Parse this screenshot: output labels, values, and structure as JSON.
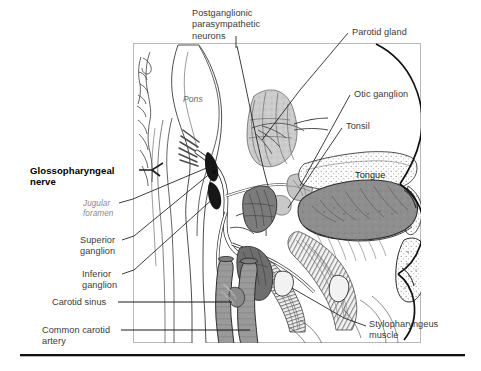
{
  "figure": {
    "title_none": "",
    "frame": {
      "x": 133,
      "y": 43,
      "width": 288,
      "height": 300,
      "border_color": "#b9b9b9"
    },
    "baseline_rule": {
      "x": 20,
      "y": 355,
      "width": 445,
      "color": "#111111"
    },
    "colors": {
      "ink": "#2b2b2b",
      "label_text": "#3a3a3a",
      "strong_text": "#000000",
      "italic_text": "#8a8a8a",
      "leader_line": "#1b1b1b",
      "frame": "#b9b9b9",
      "parotid_fill": "#c9c9c9",
      "tongue_fill": "#8e8e8e",
      "vessel_fill": "#9a9a9a",
      "tonsil_fill": "#bdbdbd",
      "muscle_fill": "#7e7e7e",
      "dark_ganglion": "#171717",
      "bone_fill": "#fbfbfb",
      "page_bg": "#ffffff"
    },
    "labels": [
      {
        "name": "postganglionic-parasympathetic-neurons",
        "text": "Postganglionic\nparasympathetic\nneurons",
        "x": 192,
        "y": 8,
        "style": "plain",
        "align": "left"
      },
      {
        "name": "parotid-gland",
        "text": "Parotid gland",
        "x": 352,
        "y": 28,
        "style": "plain",
        "align": "left"
      },
      {
        "name": "otic-ganglion",
        "text": "Otic ganglion",
        "x": 354,
        "y": 90,
        "style": "plain",
        "align": "left"
      },
      {
        "name": "tonsil",
        "text": "Tonsil",
        "x": 346,
        "y": 122,
        "style": "plain",
        "align": "left"
      },
      {
        "name": "tongue",
        "text": "Tongue",
        "x": 355,
        "y": 171,
        "style": "on-art",
        "align": "left"
      },
      {
        "name": "pons",
        "text": "Pons",
        "x": 183,
        "y": 96,
        "style": "italic-on-art",
        "align": "left"
      },
      {
        "name": "glossopharyngeal-nerve",
        "text": "Glossopharyngeal\nnerve",
        "x": 30,
        "y": 166,
        "style": "strong",
        "align": "left"
      },
      {
        "name": "jugular-foramen",
        "text": "Jugular\nforamen",
        "x": 83,
        "y": 200,
        "style": "italic",
        "align": "left"
      },
      {
        "name": "superior-ganglion",
        "text": "Superior\nganglion",
        "x": 80,
        "y": 236,
        "style": "plain",
        "align": "left"
      },
      {
        "name": "inferior-ganglion",
        "text": "Inferior\nganglion",
        "x": 82,
        "y": 270,
        "style": "plain",
        "align": "left"
      },
      {
        "name": "carotid-sinus",
        "text": "Carotid sinus",
        "x": 52,
        "y": 298,
        "style": "plain",
        "align": "left"
      },
      {
        "name": "common-carotid-artery",
        "text": "Common carotid\nartery",
        "x": 42,
        "y": 326,
        "style": "plain",
        "align": "left"
      },
      {
        "name": "stylopharyngeus-muscle",
        "text": "Stylopharyngeus\nmuscle",
        "x": 369,
        "y": 320,
        "style": "plain",
        "align": "left"
      }
    ],
    "structures": [
      {
        "name": "brainstem-pons",
        "fill": "#ffffff",
        "note": "outlined brainstem with pons at upper left of frame"
      },
      {
        "name": "parotid-gland-mass",
        "fill": "#c9c9c9",
        "note": "lobulated light gray gland, mid-upper frame"
      },
      {
        "name": "tongue-mass",
        "fill": "#8e8e8e",
        "note": "large gray tongue body, right of center"
      },
      {
        "name": "tonsil-mass",
        "fill": "#bdbdbd",
        "note": "small light gray oval below parotid"
      },
      {
        "name": "stylopharyngeus-muscle-bundle",
        "fill": "#7e7e7e",
        "note": "striated muscle fan, lower center"
      },
      {
        "name": "carotid-vessels",
        "fill": "#9a9a9a",
        "note": "vertical gray vessel trunks, lower left of frame"
      },
      {
        "name": "superior-inferior-ganglia",
        "fill": "#171717",
        "note": "dark ganglion swellings on nerve near jugular foramen"
      },
      {
        "name": "hard-palate-bone",
        "fill": "#fbfbfb",
        "note": "stippled bone band above tongue"
      },
      {
        "name": "face-profile",
        "fill": "none",
        "note": "black outline of nose, lips, chin at right"
      },
      {
        "name": "glossopharyngeal-nerve-trunk",
        "fill": "#ffffff",
        "note": "thin white nerve cord traced from brainstem to tongue"
      }
    ]
  }
}
